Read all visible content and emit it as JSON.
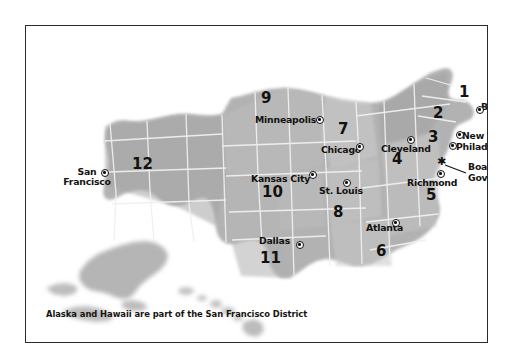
{
  "figure": {
    "caption": "Alaska and Hawaii are part of the San Francisco District",
    "board_label_line1": "Board of",
    "board_label_line2": "Governors"
  },
  "colors": {
    "frame_border": "#2b2b2b",
    "background": "#ffffff",
    "land_dark": "#a9a9a9",
    "land_mid": "#b4b4b4",
    "land_light": "#c6c6c6",
    "land_lighter": "#d2d2d2",
    "state_border": "#f2f2f2",
    "text": "#14120f",
    "marker_fill": "#ffffff",
    "marker_stroke": "#101010"
  },
  "districts": [
    {
      "number": "1",
      "x": 437,
      "y": 67,
      "bank": "Boston"
    },
    {
      "number": "2",
      "x": 412,
      "y": 88,
      "bank": "New York"
    },
    {
      "number": "3",
      "x": 407,
      "y": 112,
      "bank": "Philadelphia"
    },
    {
      "number": "4",
      "x": 371,
      "y": 134,
      "bank": "Cleveland"
    },
    {
      "number": "5",
      "x": 405,
      "y": 170,
      "bank": "Richmond"
    },
    {
      "number": "6",
      "x": 355,
      "y": 226,
      "bank": "Atlanta"
    },
    {
      "number": "7",
      "x": 317,
      "y": 104,
      "bank": "Chicago"
    },
    {
      "number": "8",
      "x": 312,
      "y": 187,
      "bank": "St. Louis"
    },
    {
      "number": "9",
      "x": 240,
      "y": 73,
      "bank": "Minneapolis"
    },
    {
      "number": "10",
      "x": 246,
      "y": 167,
      "bank": "Kansas City"
    },
    {
      "number": "11",
      "x": 244,
      "y": 233,
      "bank": "Dallas"
    },
    {
      "number": "12",
      "x": 116,
      "y": 139,
      "bank": "San Francisco"
    }
  ],
  "cities": [
    {
      "name": "Boston",
      "label_x": 455,
      "label_y": 80,
      "dot_x": 450,
      "dot_y": 84,
      "align": "left"
    },
    {
      "name": "New York",
      "label_x": 435,
      "label_y": 111,
      "dot_x": 430,
      "dot_y": 109,
      "align": "left"
    },
    {
      "name": "Philadelphia",
      "label_x": 430,
      "label_y": 122,
      "dot_x": 423,
      "dot_y": 120,
      "align": "left"
    },
    {
      "name": "Cleveland",
      "label_x": 356,
      "label_y": 124,
      "dot_x": 381,
      "dot_y": 114,
      "align": "center"
    },
    {
      "name": "Richmond",
      "label_x": 382,
      "label_y": 158,
      "dot_x": 411,
      "dot_y": 148,
      "align": "center"
    },
    {
      "name": "Atlanta",
      "label_x": 338,
      "label_y": 203,
      "dot_x": 366,
      "dot_y": 197,
      "align": "center"
    },
    {
      "name": "Chicago",
      "label_x": 294,
      "label_y": 125,
      "dot_x": 330,
      "dot_y": 121,
      "align": "center"
    },
    {
      "name": "St. Louis",
      "label_x": 294,
      "label_y": 166,
      "dot_x": 317,
      "dot_y": 157,
      "align": "center"
    },
    {
      "name": "Minneapolis",
      "label_x": 230,
      "label_y": 95,
      "dot_x": 290,
      "dot_y": 94,
      "align": "left"
    },
    {
      "name": "Kansas City",
      "label_x": 226,
      "label_y": 155,
      "dot_x": 283,
      "dot_y": 149,
      "align": "left"
    },
    {
      "name": "Dallas",
      "label_x": 234,
      "label_y": 216,
      "dot_x": 270,
      "dot_y": 219,
      "align": "left"
    },
    {
      "name": "San Francisco",
      "label_x": 48,
      "label_y": 152,
      "dot_x": 75,
      "dot_y": 147,
      "align": "center",
      "two_line": true,
      "line1": "San",
      "line2": "Francisco"
    }
  ],
  "board_of_governors": {
    "star_x": 415,
    "star_y": 136,
    "label_x": 444,
    "label_y": 143,
    "glyph": "star-marker"
  },
  "map_notes": {
    "alaska_region": "lower-left inset, San Francisco district",
    "hawaii_region": "island chain south-central, San Francisco district"
  }
}
